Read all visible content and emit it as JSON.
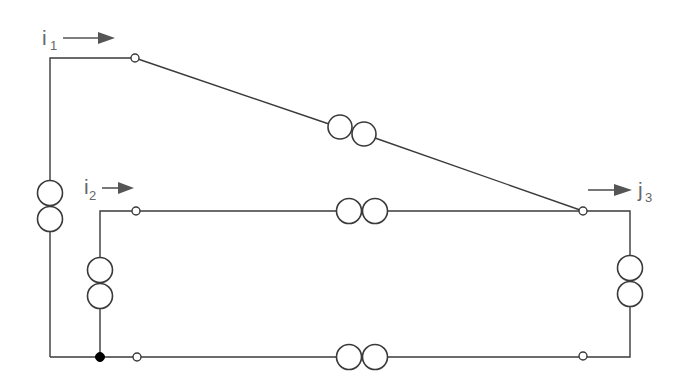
{
  "diagram": {
    "type": "network-circuit",
    "stroke_color": "#3a3a3a",
    "label_color": "#666666",
    "currents": [
      {
        "id": "i1",
        "symbol": "i",
        "subscript": "1",
        "direction": "right"
      },
      {
        "id": "i2",
        "symbol": "i",
        "subscript": "2",
        "direction": "right"
      },
      {
        "id": "j3",
        "symbol": "j",
        "subscript": "3",
        "direction": "right"
      }
    ],
    "branches": [
      {
        "id": "left-outer",
        "element": "transformer",
        "orientation": "vertical"
      },
      {
        "id": "diagonal",
        "element": "transformer",
        "orientation": "diagonal"
      },
      {
        "id": "middle",
        "element": "transformer",
        "orientation": "horizontal"
      },
      {
        "id": "left-inner",
        "element": "transformer",
        "orientation": "vertical"
      },
      {
        "id": "right",
        "element": "transformer",
        "orientation": "vertical"
      },
      {
        "id": "bottom",
        "element": "transformer",
        "orientation": "horizontal"
      }
    ],
    "nodes": [
      {
        "id": "n-top",
        "kind": "open"
      },
      {
        "id": "n-mid-left",
        "kind": "open"
      },
      {
        "id": "n-mid-right",
        "kind": "open"
      },
      {
        "id": "n-bottom-junction",
        "kind": "filled"
      },
      {
        "id": "n-bottom-left",
        "kind": "open"
      },
      {
        "id": "n-bottom-right",
        "kind": "open"
      }
    ]
  }
}
